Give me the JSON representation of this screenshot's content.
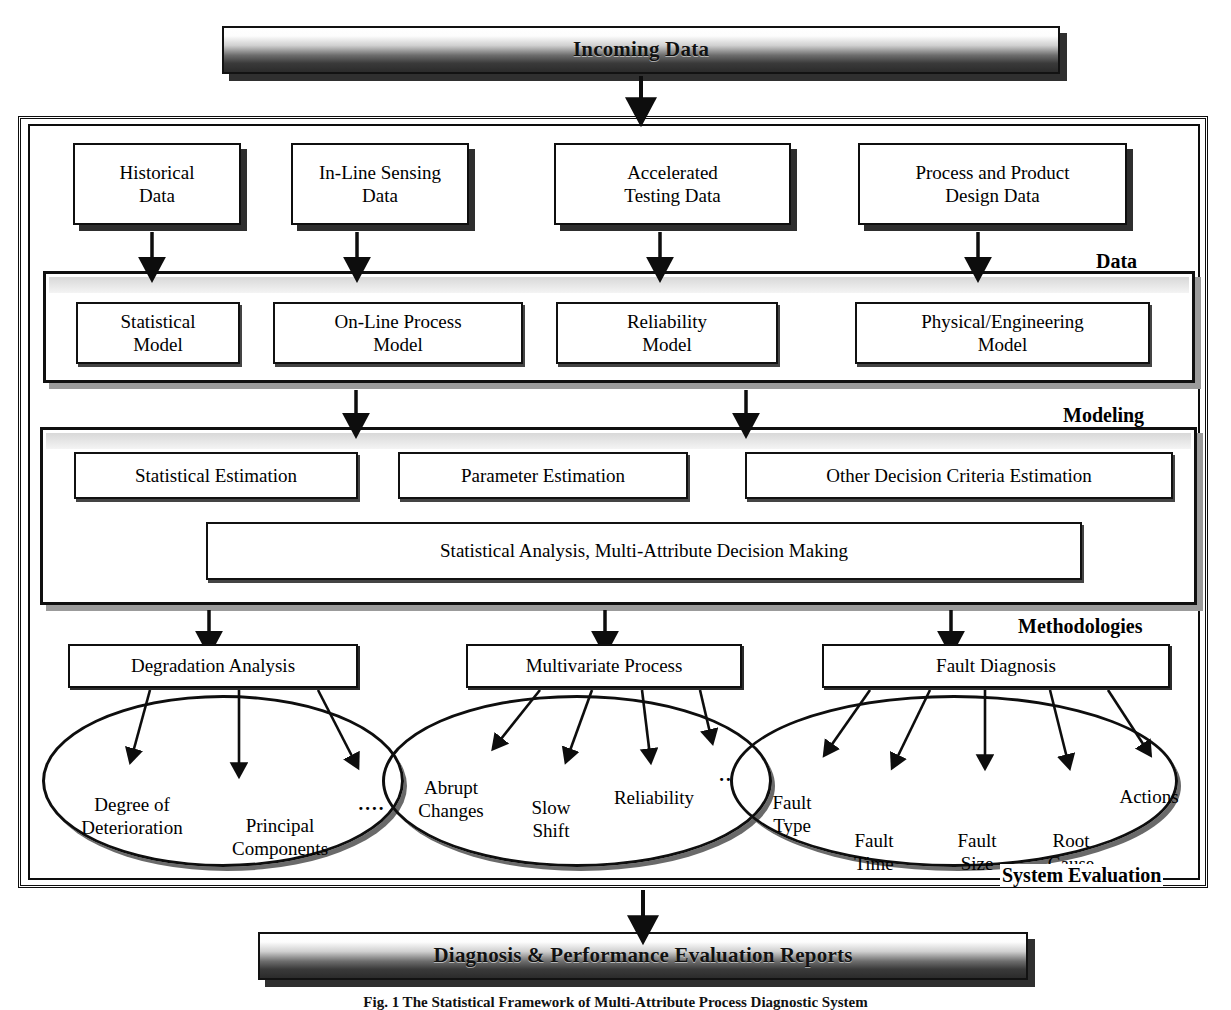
{
  "header_banner": {
    "label": "Incoming Data"
  },
  "footer_banner": {
    "label": "Diagnosis & Performance Evaluation Reports"
  },
  "caption": {
    "text": "Fig. 1 The Statistical Framework of Multi-Attribute Process Diagnostic System"
  },
  "section_labels": {
    "data": "Data",
    "modeling": "Modeling",
    "methodologies": "Methodologies",
    "system_evaluation": "System Evaluation"
  },
  "data_sources": [
    {
      "label": "Historical\nData"
    },
    {
      "label": "In-Line Sensing\nData"
    },
    {
      "label": "Accelerated\nTesting Data"
    },
    {
      "label": "Process and Product\nDesign Data"
    }
  ],
  "models": [
    {
      "label": "Statistical\nModel"
    },
    {
      "label": "On-Line Process\nModel"
    },
    {
      "label": "Reliability\nModel"
    },
    {
      "label": "Physical/Engineering\nModel"
    }
  ],
  "estimations": [
    {
      "label": "Statistical Estimation"
    },
    {
      "label": "Parameter Estimation"
    },
    {
      "label": "Other Decision Criteria Estimation"
    }
  ],
  "analysis": {
    "label": "Statistical Analysis, Multi-Attribute Decision Making"
  },
  "methodologies": [
    {
      "label": "Degradation Analysis",
      "outcomes": [
        "Degree of\nDeterioration",
        "Principal\nComponents",
        "...."
      ]
    },
    {
      "label": "Multivariate Process",
      "outcomes": [
        "Abrupt\nChanges",
        "Slow\nShift",
        "Reliability",
        ".."
      ]
    },
    {
      "label": "Fault Diagnosis",
      "outcomes": [
        "Fault\nType",
        "Fault\nTime",
        "Fault\nSize",
        "Root\nCause",
        "Actions"
      ]
    }
  ],
  "colors": {
    "ink": "#0d0d0d",
    "shadow": "#2e2e2e",
    "group_shadow": "#9b9b9b",
    "banner_dark": "#2b2b2b"
  }
}
